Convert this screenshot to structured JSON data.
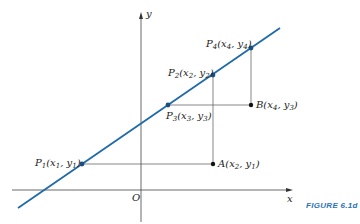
{
  "figure": {
    "caption": "FIGURE 6.1d",
    "caption_color": "#2a73b8",
    "line_color": "#1f6aa8",
    "axis_labels": {
      "x": "x",
      "y": "y",
      "origin": "O"
    },
    "points": {
      "P1": {
        "name": "P",
        "sub": "1",
        "coords": [
          "x",
          "1",
          "y",
          "1"
        ]
      },
      "P2": {
        "name": "P",
        "sub": "2",
        "coords": [
          "x",
          "2",
          "y",
          "2"
        ]
      },
      "P3": {
        "name": "P",
        "sub": "3",
        "coords": [
          "x",
          "3",
          "y",
          "3"
        ]
      },
      "P4": {
        "name": "P",
        "sub": "4",
        "coords": [
          "x",
          "4",
          "y",
          "4"
        ]
      },
      "A": {
        "name": "A",
        "sub": "",
        "coords": [
          "x",
          "2",
          "y",
          "1"
        ]
      },
      "B": {
        "name": "B",
        "sub": "",
        "coords": [
          "x",
          "4",
          "y",
          "3"
        ]
      }
    }
  }
}
